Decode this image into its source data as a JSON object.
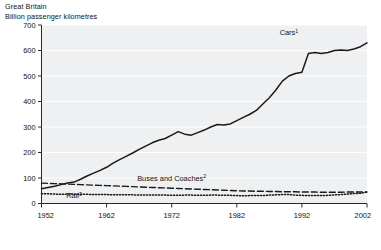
{
  "header": {
    "region": "Great Britain",
    "units": "Billion passenger kilometres"
  },
  "chart_data": {
    "type": "line",
    "title": "Great Britain",
    "subtitle": "Billion passenger kilometres",
    "xlabel": "",
    "ylabel": "Billion passenger kilometres",
    "xlim": [
      1952,
      2002
    ],
    "ylim": [
      0,
      700
    ],
    "ytick_step": 100,
    "ytick_labels": [
      "0",
      "100",
      "200",
      "300",
      "400",
      "500",
      "600",
      "700"
    ],
    "ytick_values": [
      0,
      100,
      200,
      300,
      400,
      500,
      600,
      700
    ],
    "xtick_labels": [
      "1952",
      "1962",
      "1972",
      "1982",
      "1992",
      "2002"
    ],
    "xtick_values": [
      1952,
      1962,
      1972,
      1982,
      1992,
      2002
    ],
    "grid": true,
    "grid_color": "#ffffff",
    "plot_background": "#eff0f2",
    "legend_position": "inline-annotations",
    "line_color": "#1a1a1a",
    "x": [
      1952,
      1953,
      1954,
      1955,
      1956,
      1957,
      1958,
      1959,
      1960,
      1961,
      1962,
      1963,
      1964,
      1965,
      1966,
      1967,
      1968,
      1969,
      1970,
      1971,
      1972,
      1973,
      1974,
      1975,
      1976,
      1977,
      1978,
      1979,
      1980,
      1981,
      1982,
      1983,
      1984,
      1985,
      1986,
      1987,
      1988,
      1989,
      1990,
      1991,
      1992,
      1993,
      1994,
      1995,
      1996,
      1997,
      1998,
      1999,
      2000,
      2001,
      2002
    ],
    "series": [
      {
        "name": "Cars",
        "label": "Cars",
        "footnote": "1",
        "style": "solid",
        "label_x": 1990,
        "label_y": 660,
        "values": [
          58,
          63,
          68,
          74,
          80,
          84,
          95,
          108,
          119,
          130,
          142,
          158,
          172,
          185,
          198,
          212,
          225,
          238,
          248,
          255,
          268,
          282,
          272,
          268,
          278,
          288,
          300,
          310,
          308,
          312,
          325,
          338,
          350,
          365,
          390,
          415,
          445,
          480,
          500,
          510,
          515,
          588,
          592,
          588,
          592,
          600,
          602,
          600,
          606,
          615,
          630
        ]
      },
      {
        "name": "Buses and Coaches",
        "label": "Buses and Coaches",
        "footnote": "2",
        "style": "dashed",
        "label_x": 1972,
        "label_y": 88,
        "values": [
          80,
          79,
          78,
          77,
          76,
          75,
          74,
          73,
          72,
          71,
          70,
          69,
          68,
          67,
          66,
          65,
          64,
          63,
          62,
          61,
          60,
          59,
          58,
          57,
          56,
          55,
          54,
          53,
          52,
          51,
          50,
          49,
          49,
          48,
          48,
          47,
          47,
          46,
          46,
          46,
          45,
          45,
          45,
          44,
          44,
          44,
          44,
          45,
          45,
          45,
          45
        ]
      },
      {
        "name": "Rail",
        "label": "Rail",
        "footnote": "3",
        "style": "dotted",
        "label_x": 1957,
        "label_y": 20,
        "values": [
          38,
          38,
          37,
          36,
          37,
          37,
          36,
          36,
          35,
          35,
          35,
          34,
          34,
          34,
          34,
          33,
          33,
          33,
          33,
          33,
          32,
          32,
          33,
          33,
          32,
          32,
          33,
          33,
          32,
          32,
          31,
          30,
          31,
          31,
          31,
          33,
          34,
          35,
          35,
          33,
          32,
          31,
          31,
          31,
          32,
          34,
          35,
          37,
          39,
          40,
          45
        ]
      }
    ]
  }
}
